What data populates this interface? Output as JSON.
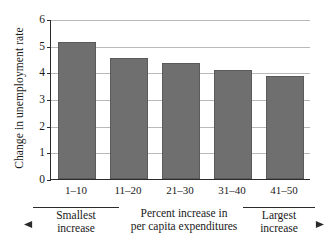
{
  "chart_data": {
    "type": "bar",
    "title": "",
    "xlabel": "Percent increase in per capita expenditures",
    "ylabel": "Change in unemployment rate",
    "categories": [
      "1–10",
      "11–20",
      "21–30",
      "31–40",
      "41–50"
    ],
    "values": [
      5.15,
      4.55,
      4.35,
      4.08,
      3.88
    ],
    "ylim": [
      0,
      6
    ],
    "yticks": [
      0,
      1,
      2,
      3,
      4,
      5,
      6
    ],
    "ytick_labels": [
      "0",
      "1",
      "2",
      "3",
      "4",
      "5",
      "6"
    ],
    "grid": true,
    "legend": false,
    "bar_color": "#6f6f6f",
    "annotations": {
      "left": {
        "line1": "Smallest",
        "line2": "increase",
        "arrow": "arrow-left-icon"
      },
      "middle": {
        "line1": "Percent increase in",
        "line2": "per capita expenditures"
      },
      "right": {
        "line1": "Largest",
        "line2": "increase",
        "arrow": "arrow-right-icon"
      }
    }
  }
}
